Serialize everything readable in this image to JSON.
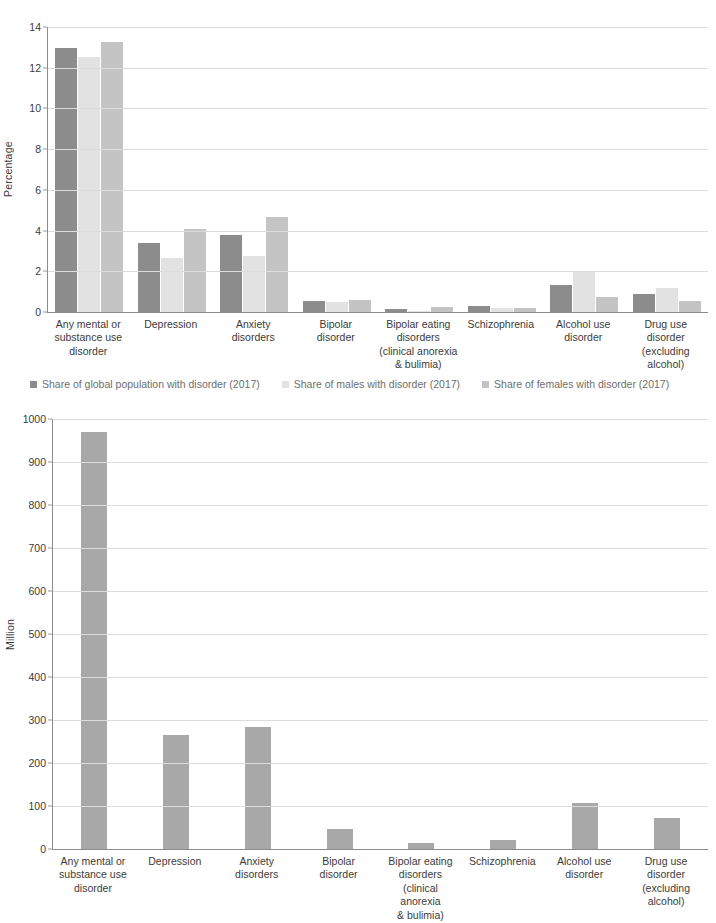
{
  "chart_data": [
    {
      "type": "bar",
      "title": "",
      "xlabel": "",
      "ylabel": "Percentage",
      "ylim": [
        0,
        14
      ],
      "yticks": [
        0,
        2,
        4,
        6,
        8,
        10,
        12,
        14
      ],
      "grid": true,
      "legend_position": "bottom",
      "categories": [
        "Any mental or\nsubstance use\ndisorder",
        "Depression",
        "Anxiety\ndisorders",
        "Bipolar\ndisorder",
        "Bipolar eating\ndisorders\n(clinical anorexia\n& bulimia)",
        "Schizophrenia",
        "Alcohol use\ndisorder",
        "Drug use\ndisorder\n(excluding\nalcohol)"
      ],
      "series": [
        {
          "name": "Share of global population with disorder (2017)",
          "color": "#8c8c8c",
          "values": [
            12.95,
            3.38,
            3.78,
            0.55,
            0.17,
            0.28,
            1.32,
            0.87
          ]
        },
        {
          "name": "Share of males with disorder (2017)",
          "color": "#e2e2e2",
          "values": [
            12.55,
            2.65,
            2.75,
            0.49,
            0.07,
            0.2,
            1.98,
            1.2
          ]
        },
        {
          "name": "Share of females with disorder (2017)",
          "color": "#c4c4c4",
          "values": [
            13.28,
            4.07,
            4.65,
            0.6,
            0.27,
            0.21,
            0.75,
            0.53
          ]
        }
      ]
    },
    {
      "type": "bar",
      "title": "",
      "xlabel": "",
      "ylabel": "Million",
      "ylim": [
        0,
        1000
      ],
      "yticks": [
        0,
        100,
        200,
        300,
        400,
        500,
        600,
        700,
        800,
        900,
        1000
      ],
      "grid": true,
      "legend_position": "none",
      "categories": [
        "Any mental or\nsubstance use\ndisorder",
        "Depression",
        "Anxiety\ndisorders",
        "Bipolar\ndisorder",
        "Bipolar eating\ndisorders\n(clinical anorexia\n& bulimia)",
        "Schizophrenia",
        "Alcohol use\ndisorder",
        "Drug use\ndisorder\n(excluding alcohol)"
      ],
      "series": [
        {
          "name": "Number with disorder (2017)",
          "color": "#a8a8a8",
          "values": [
            970,
            264,
            284,
            46,
            14,
            20,
            107,
            71
          ]
        }
      ]
    }
  ],
  "colors": {
    "axis": "#8c8c8c",
    "grid": "#dcdcdc",
    "text": "#3b3b3b",
    "legend_text": "#6e6e6e",
    "series_global": "#8c8c8c",
    "series_males": "#e2e2e2",
    "series_females": "#c4c4c4",
    "series_count": "#a8a8a8"
  }
}
